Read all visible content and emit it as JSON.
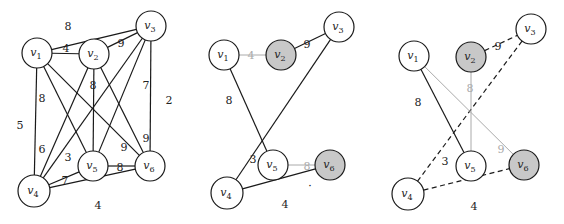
{
  "figure": {
    "colors": {
      "edge": "#1a1a1a",
      "edge_gray": "#aaaaaa",
      "node_fill": "#ffffff",
      "node_fill_highlight": "#c8c8c8",
      "node_stroke": "#1a1a1a"
    },
    "panels": [
      {
        "id": "panel-1",
        "nodes": [
          {
            "id": "v1",
            "label": "v",
            "sub": "1",
            "x": 37,
            "y": 53,
            "r": 15,
            "highlight": false
          },
          {
            "id": "v2",
            "label": "v",
            "sub": "2",
            "x": 94,
            "y": 54,
            "r": 15,
            "highlight": false
          },
          {
            "id": "v3",
            "label": "v",
            "sub": "3",
            "x": 151,
            "y": 26,
            "r": 15,
            "highlight": false
          },
          {
            "id": "v4",
            "label": "v",
            "sub": "4",
            "x": 34,
            "y": 191,
            "r": 16,
            "highlight": false
          },
          {
            "id": "v5",
            "label": "v",
            "sub": "5",
            "x": 93,
            "y": 166,
            "r": 15,
            "highlight": false
          },
          {
            "id": "v6",
            "label": "v",
            "sub": "6",
            "x": 150,
            "y": 166,
            "r": 15,
            "highlight": false
          }
        ],
        "edges": [
          {
            "from": "v1",
            "to": "v3",
            "weight": "8",
            "style": "solid",
            "lx": 68,
            "ly": 27
          },
          {
            "from": "v1",
            "to": "v2",
            "weight": "4",
            "style": "solid",
            "lx": 66,
            "ly": 49
          },
          {
            "from": "v2",
            "to": "v3",
            "weight": "9",
            "style": "solid",
            "lx": 121,
            "ly": 44
          },
          {
            "from": "v1",
            "to": "v4",
            "weight": "5",
            "style": "solid",
            "lx": 20,
            "ly": 126
          },
          {
            "from": "v1",
            "to": "v5",
            "weight": "8",
            "style": "solid",
            "lx": 42,
            "ly": 99
          },
          {
            "from": "v1",
            "to": "v6",
            "weight": "9",
            "style": "solid",
            "lx": 124,
            "ly": 148
          },
          {
            "from": "v2",
            "to": "v5",
            "weight": "8",
            "style": "solid",
            "lx": 93,
            "ly": 86
          },
          {
            "from": "v2",
            "to": "v6",
            "weight": "9",
            "style": "solid",
            "lx": 146,
            "ly": 139
          },
          {
            "from": "v2",
            "to": "v4",
            "weight": "6",
            "style": "solid",
            "lx": 42,
            "ly": 150
          },
          {
            "from": "v3",
            "to": "v4",
            "weight": "3",
            "style": "solid",
            "lx": 68,
            "ly": 158
          },
          {
            "from": "v3",
            "to": "v5",
            "weight": "7",
            "style": "solid",
            "lx": 146,
            "ly": 86
          },
          {
            "from": "v3",
            "to": "v6",
            "weight": "2",
            "style": "solid",
            "lx": 169,
            "ly": 101
          },
          {
            "from": "v4",
            "to": "v5",
            "weight": "7",
            "style": "solid",
            "lx": 65,
            "ly": 181
          },
          {
            "from": "v5",
            "to": "v6",
            "weight": "8",
            "style": "solid",
            "lx": 120,
            "ly": 168
          },
          {
            "from": "v4",
            "to": "v6",
            "weight": "4",
            "style": "solid",
            "lx": 98,
            "ly": 206
          }
        ]
      },
      {
        "id": "panel-2",
        "nodes": [
          {
            "id": "v1",
            "label": "v",
            "sub": "1",
            "x": 224,
            "y": 55,
            "r": 15,
            "highlight": false
          },
          {
            "id": "v2",
            "label": "v",
            "sub": "2",
            "x": 281,
            "y": 55,
            "r": 15,
            "highlight": true
          },
          {
            "id": "v3",
            "label": "v",
            "sub": "3",
            "x": 339,
            "y": 27,
            "r": 15,
            "highlight": false
          },
          {
            "id": "v4",
            "label": "v",
            "sub": "4",
            "x": 227,
            "y": 193,
            "r": 16,
            "highlight": false
          },
          {
            "id": "v5",
            "label": "v",
            "sub": "5",
            "x": 273,
            "y": 165,
            "r": 15,
            "highlight": false
          },
          {
            "id": "v6",
            "label": "v",
            "sub": "6",
            "x": 330,
            "y": 165,
            "r": 15,
            "highlight": true
          }
        ],
        "edges": [
          {
            "from": "v1",
            "to": "v2",
            "weight": "4",
            "style": "gray",
            "lx": 251,
            "ly": 56
          },
          {
            "from": "v2",
            "to": "v3",
            "weight": "9",
            "style": "solid",
            "lx": 307,
            "ly": 45
          },
          {
            "from": "v1",
            "to": "v5",
            "weight": "8",
            "style": "solid",
            "lx": 229,
            "ly": 101
          },
          {
            "from": "v3",
            "to": "v4",
            "weight": "3",
            "style": "solid",
            "lx": 253,
            "ly": 160
          },
          {
            "from": "v5",
            "to": "v6",
            "weight": "8",
            "style": "gray",
            "lx": 307,
            "ly": 167
          },
          {
            "from": "v4",
            "to": "v6",
            "weight": "4",
            "style": "solid",
            "lx": 285,
            "ly": 205
          }
        ]
      },
      {
        "id": "panel-3",
        "nodes": [
          {
            "id": "v1",
            "label": "v",
            "sub": "1",
            "x": 414,
            "y": 56,
            "r": 15,
            "highlight": false
          },
          {
            "id": "v2",
            "label": "v",
            "sub": "2",
            "x": 471,
            "y": 57,
            "r": 15,
            "highlight": true
          },
          {
            "id": "v3",
            "label": "v",
            "sub": "3",
            "x": 531,
            "y": 29,
            "r": 15,
            "highlight": false
          },
          {
            "id": "v4",
            "label": "v",
            "sub": "4",
            "x": 408,
            "y": 194,
            "r": 16,
            "highlight": false
          },
          {
            "id": "v5",
            "label": "v",
            "sub": "5",
            "x": 471,
            "y": 166,
            "r": 15,
            "highlight": false
          },
          {
            "id": "v6",
            "label": "v",
            "sub": "6",
            "x": 524,
            "y": 165,
            "r": 15,
            "highlight": true
          }
        ],
        "edges": [
          {
            "from": "v2",
            "to": "v3",
            "weight": "9",
            "style": "dashed",
            "lx": 498,
            "ly": 47
          },
          {
            "from": "v3",
            "to": "v4",
            "weight": "3",
            "style": "dashed",
            "lx": 445,
            "ly": 162
          },
          {
            "from": "v4",
            "to": "v6",
            "weight": "4",
            "style": "dashed",
            "lx": 474,
            "ly": 207
          },
          {
            "from": "v1",
            "to": "v5",
            "weight": "8",
            "style": "solid",
            "lx": 418,
            "ly": 103
          },
          {
            "from": "v2",
            "to": "v5",
            "weight": "8",
            "style": "gray",
            "lx": 470,
            "ly": 89
          },
          {
            "from": "v1",
            "to": "v6",
            "weight": "9",
            "style": "gray",
            "lx": 501,
            "ly": 150
          }
        ]
      }
    ],
    "stray_marks": [
      {
        "panel": "panel-2",
        "x": 310,
        "y": 190,
        "glyph": "·"
      }
    ]
  }
}
